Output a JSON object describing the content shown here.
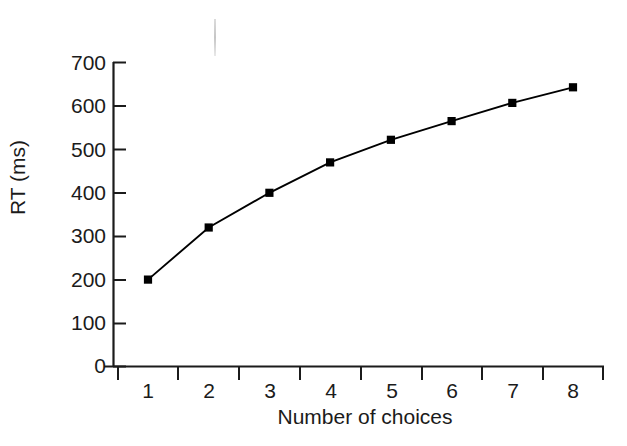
{
  "chart_data": {
    "type": "line",
    "title": "",
    "xlabel": "Number of choices",
    "ylabel": "RT (ms)",
    "x": [
      1,
      2,
      3,
      4,
      5,
      6,
      7,
      8
    ],
    "values": [
      200,
      320,
      400,
      470,
      522,
      565,
      607,
      643
    ],
    "series": [
      {
        "name": "RT",
        "values": [
          200,
          320,
          400,
          470,
          522,
          565,
          607,
          643
        ]
      }
    ],
    "xticklabels": [
      "1",
      "2",
      "3",
      "4",
      "5",
      "6",
      "7",
      "8"
    ],
    "yticklabels": [
      "0",
      "100",
      "200",
      "300",
      "400",
      "500",
      "600",
      "700"
    ],
    "yticks": [
      0,
      100,
      200,
      300,
      400,
      500,
      600,
      700
    ],
    "xlim": [
      0.55,
      8.6
    ],
    "ylim": [
      0,
      700
    ],
    "grid": false,
    "legend": null,
    "marker": "square",
    "marker_color": "#000000",
    "line_color": "#000000",
    "background_color": "#ffffff",
    "axis_color": "#1b1b1b",
    "minor_xticks_between_labels": true,
    "annotations": []
  },
  "figure": {
    "scan_artifact_label": "scan-line-artifact"
  }
}
